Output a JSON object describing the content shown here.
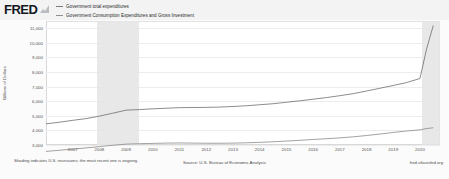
{
  "header": {
    "logo_text": "FRED",
    "logo_glyph": "chart-glyph"
  },
  "legend": {
    "position": "top",
    "items": [
      {
        "label": "Government total expenditures",
        "color": "#7b7b7b"
      },
      {
        "label": "Government Consumption Expenditures and Gross Investment",
        "color": "#8e8e8e"
      }
    ]
  },
  "footer": {
    "note": "Shading indicates U.S. recessions; the most recent one is ongoing.",
    "source": "Source: U.S. Bureau of Economic Analysis",
    "attribution": "fred.stlouisfed.org"
  },
  "chart_data": {
    "type": "line",
    "title": "",
    "xlabel": "",
    "ylabel": "Billions of Dollars",
    "ylim": [
      3000,
      11500
    ],
    "yticks": [
      3000,
      4000,
      5000,
      6000,
      7000,
      8000,
      9000,
      10000,
      11000
    ],
    "ytick_labels": [
      "3,000",
      "4,000",
      "5,000",
      "6,000",
      "7,000",
      "8,000",
      "9,000",
      "10,000",
      "11,000"
    ],
    "xlim": [
      2006.0,
      2020.75
    ],
    "xticks": [
      2007,
      2008,
      2009,
      2010,
      2011,
      2012,
      2013,
      2014,
      2015,
      2016,
      2017,
      2018,
      2019,
      2020
    ],
    "xtick_labels": [
      "2007",
      "2008",
      "2009",
      "2010",
      "2011",
      "2012",
      "2013",
      "2014",
      "2015",
      "2016",
      "2017",
      "2018",
      "2019",
      "2020"
    ],
    "grid": true,
    "legend_position": "top",
    "recessions": [
      {
        "start": 2007.92,
        "end": 2009.5
      },
      {
        "start": 2020.08,
        "end": 2020.75
      }
    ],
    "x": [
      2006.0,
      2006.5,
      2007.0,
      2007.5,
      2008.0,
      2008.5,
      2009.0,
      2009.5,
      2010.0,
      2010.5,
      2011.0,
      2011.5,
      2012.0,
      2012.5,
      2013.0,
      2013.5,
      2014.0,
      2014.5,
      2015.0,
      2015.5,
      2016.0,
      2016.5,
      2017.0,
      2017.5,
      2018.0,
      2018.5,
      2019.0,
      2019.5,
      2020.0,
      2020.25,
      2020.5
    ],
    "series": [
      {
        "name": "Government total expenditures",
        "color": "#6f6f6f",
        "values": [
          4450,
          4560,
          4690,
          4810,
          4980,
          5180,
          5390,
          5430,
          5480,
          5520,
          5560,
          5570,
          5580,
          5600,
          5640,
          5690,
          5760,
          5830,
          5930,
          6030,
          6140,
          6250,
          6380,
          6520,
          6700,
          6890,
          7080,
          7280,
          7560,
          9600,
          11200
        ]
      },
      {
        "name": "Government Consumption Expenditures and Gross Investment",
        "color": "#8a8a8a",
        "values": [
          2560,
          2640,
          2720,
          2800,
          2890,
          2980,
          3060,
          3090,
          3110,
          3130,
          3140,
          3130,
          3120,
          3120,
          3130,
          3150,
          3180,
          3220,
          3270,
          3320,
          3380,
          3430,
          3490,
          3560,
          3650,
          3750,
          3860,
          3960,
          4040,
          4130,
          4180
        ]
      }
    ]
  }
}
